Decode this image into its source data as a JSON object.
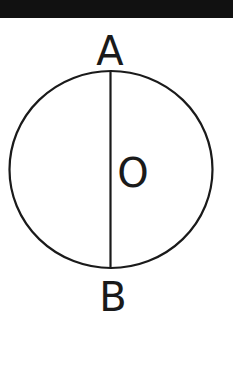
{
  "diagram": {
    "type": "circle-with-diameter",
    "labels": {
      "top_point": "A",
      "bottom_point": "B",
      "center": "O"
    },
    "colors": {
      "stroke": "#1a1a1a",
      "background": "#ffffff",
      "top_band": "#111111"
    }
  }
}
